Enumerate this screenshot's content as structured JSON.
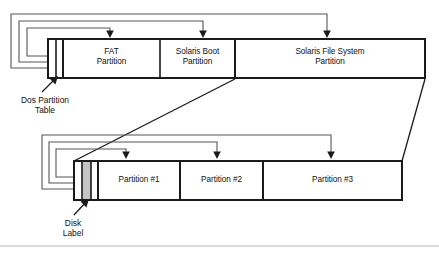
{
  "figure": {
    "colors": {
      "stroke": "#1a1a1a",
      "thin_stroke": "#555555",
      "fill": "#ffffff",
      "highlight_fill": "#c4c4c4",
      "background": "#ffffff",
      "footer_rule": "#b5b5b5"
    }
  },
  "top_bar": {
    "name": "dos-partition-bar",
    "segments": [
      {
        "key": "dos_table",
        "label": "",
        "kind": "narrow"
      },
      {
        "key": "fat",
        "label": "FAT\nPartition",
        "kind": "normal"
      },
      {
        "key": "solaris_boot",
        "label": "Solaris Boot\nPartition",
        "kind": "normal"
      },
      {
        "key": "solaris_fs",
        "label": "Solaris File System\nPartition",
        "kind": "normal"
      }
    ]
  },
  "bottom_bar": {
    "name": "solaris-slices-bar",
    "segments": [
      {
        "key": "pad",
        "label": "",
        "kind": "narrow"
      },
      {
        "key": "disk_label",
        "label": "",
        "kind": "highlight"
      },
      {
        "key": "p1",
        "label": "Partition #1",
        "kind": "normal"
      },
      {
        "key": "p2",
        "label": "Partition #2",
        "kind": "normal"
      },
      {
        "key": "p3",
        "label": "Partition #3",
        "kind": "normal"
      }
    ]
  },
  "callouts": [
    {
      "key": "dos_partition_table",
      "text": "Dos Partition\nTable"
    },
    {
      "key": "disk_label",
      "text": "Disk\nLabel"
    }
  ]
}
